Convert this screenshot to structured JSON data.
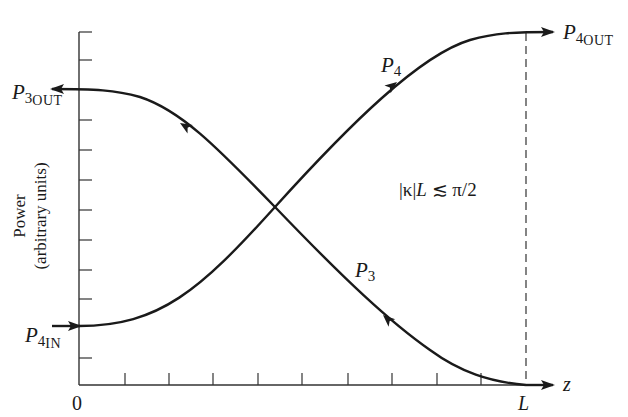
{
  "diagram": {
    "type": "coupled-mode power exchange plot",
    "y_axis": {
      "label_line1": "Power",
      "label_line2": "(arbitrary units)",
      "tick_count": 12
    },
    "x_axis": {
      "label": "z",
      "start_label": "0",
      "end_label": "L",
      "tick_count": 10
    },
    "curves": [
      {
        "name": "P4",
        "label_main": "P",
        "label_sub": "4",
        "direction": "forward (+z)",
        "start_label_main": "P",
        "start_label_sub": "4",
        "start_label_subsub": "IN",
        "end_label_main": "P",
        "end_label_sub": "4",
        "end_label_subsub": "OUT"
      },
      {
        "name": "P3",
        "label_main": "P",
        "label_sub": "3",
        "direction": "backward (−z)",
        "end_label_main": "P",
        "end_label_sub": "3",
        "end_label_subsub": "OUT"
      }
    ],
    "annotation": "|κ|L ≲ π/2",
    "annotation_parts": {
      "abs_open": "|",
      "kappa": "κ",
      "abs_close": "|",
      "L": "L",
      "relation": " ≲ π/2"
    },
    "colors": {
      "ink": "#1a1a1a",
      "background": "#ffffff"
    }
  }
}
